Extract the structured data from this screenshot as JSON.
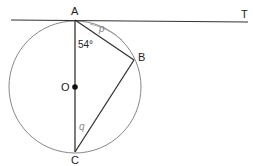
{
  "diagram": {
    "type": "circle-geometry",
    "points": {
      "A": {
        "label": "A",
        "x": 75,
        "y": 20
      },
      "B": {
        "label": "B",
        "x": 134,
        "y": 60
      },
      "C": {
        "label": "C",
        "x": 75,
        "y": 152
      },
      "O": {
        "label": "O",
        "x": 75,
        "y": 87
      },
      "T": {
        "label": "T",
        "x": 246,
        "y": 22
      }
    },
    "circle": {
      "center": "O",
      "radius": 66
    },
    "tangent_line": {
      "from_x": 11,
      "to_x": 248,
      "through": "A",
      "end_label": "T"
    },
    "segments": [
      "AB",
      "BC",
      "AC"
    ],
    "angles": {
      "CAB": {
        "label": "54°"
      },
      "p": {
        "label": "p",
        "description": "angle between tangent AT and chord AB"
      },
      "q": {
        "label": "q",
        "description": "angle ACB"
      }
    },
    "colors": {
      "line": "#333333",
      "circle": "#888888",
      "arc_label": "#999999"
    }
  }
}
